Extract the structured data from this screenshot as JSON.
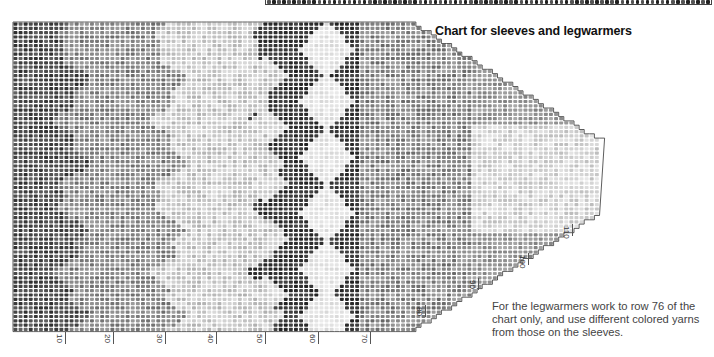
{
  "title": "Chart for sleeves and legwarmers",
  "note": "For the legwarmers work to row 76 of the chart only, and use different colored yarns from those on the sleeves.",
  "chart_data": {
    "type": "knitting-chart",
    "title": "Chart for sleeves and legwarmers",
    "orientation": "rows run left-to-right; stitches run top-to-bottom",
    "cell_pitch_px": {
      "x": 5.1,
      "y": 4.3
    },
    "origin_px": {
      "x": 13,
      "y": 22
    },
    "main_block": {
      "rows": 78,
      "stitches": 72
    },
    "taper": {
      "start_row": 78,
      "end_row": 115,
      "final_stitch_range": [
        28,
        44
      ]
    },
    "row_labels": [
      10,
      20,
      30,
      40,
      50,
      60,
      70,
      80,
      90,
      100,
      110
    ],
    "row_label_positions_px": [
      {
        "label": "10",
        "x": 65,
        "y": 332
      },
      {
        "label": "20",
        "x": 113,
        "y": 332
      },
      {
        "label": "30",
        "x": 165,
        "y": 332
      },
      {
        "label": "40",
        "x": 216,
        "y": 332
      },
      {
        "label": "50",
        "x": 265,
        "y": 332
      },
      {
        "label": "60",
        "x": 318,
        "y": 332
      },
      {
        "label": "70",
        "x": 370,
        "y": 332
      },
      {
        "label": "80",
        "x": 425,
        "y": 305
      },
      {
        "label": "90",
        "x": 478,
        "y": 278
      },
      {
        "label": "100",
        "x": 528,
        "y": 253
      },
      {
        "label": "110",
        "x": 572,
        "y": 224
      }
    ],
    "zones": [
      {
        "rows": [
          1,
          12
        ],
        "shade": "dark"
      },
      {
        "rows": [
          12,
          30
        ],
        "shade": "medium"
      },
      {
        "rows": [
          30,
          50
        ],
        "shade": "light"
      },
      {
        "rows": [
          50,
          68
        ],
        "shade": "darkest-with-white-diamonds"
      },
      {
        "rows": [
          68,
          115
        ],
        "shade": "medium-to-light"
      }
    ],
    "diamond_centers_stitch": [
      6,
      18,
      31,
      44,
      57,
      68
    ],
    "colors": {
      "ink": "#1a1a1a",
      "paper": "#ffffff",
      "grid": "#ffffff"
    }
  }
}
